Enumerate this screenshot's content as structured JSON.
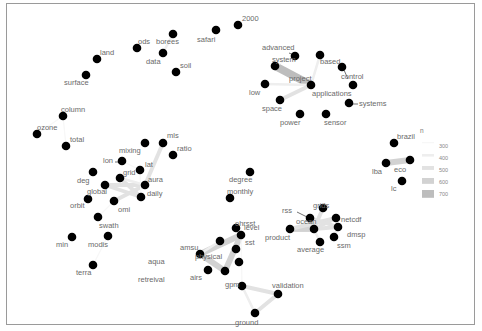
{
  "chart_data": {
    "type": "network",
    "title": "",
    "legend": {
      "title": "n",
      "position": "right",
      "entries": [
        {
          "label": "300",
          "color": "#f7f7f7",
          "width": 1
        },
        {
          "label": "400",
          "color": "#eeeeee",
          "width": 2
        },
        {
          "label": "500",
          "color": "#e2e2e2",
          "width": 3
        },
        {
          "label": "600",
          "color": "#d2d2d2",
          "width": 4.5
        },
        {
          "label": "700",
          "color": "#bdbdbd",
          "width": 6
        }
      ]
    },
    "nodes": [
      {
        "id": "2000",
        "x": 238,
        "y": 25,
        "lx": 242,
        "ly": 21
      },
      {
        "id": "safari",
        "x": 216,
        "y": 30,
        "lx": 197,
        "ly": 42
      },
      {
        "id": "borees",
        "x": 173,
        "y": 34,
        "lx": 156,
        "ly": 44
      },
      {
        "id": "ods",
        "x": 137,
        "y": 48,
        "lx": 138,
        "ly": 44
      },
      {
        "id": "data",
        "x": 163,
        "y": 53,
        "lx": 146,
        "ly": 64
      },
      {
        "id": "soil",
        "x": 176,
        "y": 72,
        "lx": 180,
        "ly": 68
      },
      {
        "id": "land",
        "x": 97,
        "y": 59,
        "lx": 100,
        "ly": 55
      },
      {
        "id": "surface",
        "x": 86,
        "y": 75,
        "lx": 64,
        "ly": 85
      },
      {
        "id": "column",
        "x": 63,
        "y": 116,
        "lx": 61,
        "ly": 112
      },
      {
        "id": "ozone",
        "x": 37,
        "y": 134,
        "lx": 37,
        "ly": 130
      },
      {
        "id": "total",
        "x": 66,
        "y": 146,
        "lx": 70,
        "ly": 142
      },
      {
        "id": "mixing",
        "x": 145,
        "y": 143,
        "lx": 119,
        "ly": 153
      },
      {
        "id": "mls",
        "x": 163,
        "y": 143,
        "lx": 167,
        "ly": 138
      },
      {
        "id": "ratio",
        "x": 173,
        "y": 155,
        "lx": 177,
        "ly": 151
      },
      {
        "id": "lon",
        "x": 122,
        "y": 161,
        "lx": 103,
        "ly": 163
      },
      {
        "id": "lat",
        "x": 140,
        "y": 170,
        "lx": 145,
        "ly": 167
      },
      {
        "id": "deg",
        "x": 93,
        "y": 172,
        "lx": 77,
        "ly": 183
      },
      {
        "id": "grid",
        "x": 120,
        "y": 178,
        "lx": 123,
        "ly": 175
      },
      {
        "id": "global",
        "x": 105,
        "y": 185,
        "lx": 87,
        "ly": 194
      },
      {
        "id": "aura",
        "x": 145,
        "y": 185,
        "lx": 148,
        "ly": 182
      },
      {
        "id": "daily",
        "x": 141,
        "y": 197,
        "lx": 147,
        "ly": 196
      },
      {
        "id": "orbit",
        "x": 88,
        "y": 199,
        "lx": 70,
        "ly": 208
      },
      {
        "id": "omi",
        "x": 114,
        "y": 201,
        "lx": 118,
        "ly": 212
      },
      {
        "id": "swath",
        "x": 98,
        "y": 217,
        "lx": 99,
        "ly": 228
      },
      {
        "id": "min",
        "x": 72,
        "y": 237,
        "lx": 56,
        "ly": 247
      },
      {
        "id": "modis",
        "x": 108,
        "y": 236,
        "lx": 88,
        "ly": 247
      },
      {
        "id": "terra",
        "x": 93,
        "y": 265,
        "lx": 76,
        "ly": 275
      },
      {
        "id": "advanced",
        "x": 295,
        "y": 56,
        "lx": 262,
        "ly": 50
      },
      {
        "id": "system",
        "x": 275,
        "y": 66,
        "lx": 272,
        "ly": 62
      },
      {
        "id": "based",
        "x": 320,
        "y": 55,
        "lx": 320,
        "ly": 64
      },
      {
        "id": "control",
        "x": 342,
        "y": 67,
        "lx": 341,
        "ly": 79
      },
      {
        "id": "project",
        "x": 311,
        "y": 85,
        "lx": 289,
        "ly": 81
      },
      {
        "id": "low",
        "x": 265,
        "y": 84,
        "lx": 249,
        "ly": 95
      },
      {
        "id": "applications",
        "x": 353,
        "y": 85,
        "lx": 312,
        "ly": 96
      },
      {
        "id": "space",
        "x": 280,
        "y": 100,
        "lx": 262,
        "ly": 111
      },
      {
        "id": "systems",
        "x": 349,
        "y": 103,
        "lx": 359,
        "ly": 106
      },
      {
        "id": "power",
        "x": 300,
        "y": 114,
        "lx": 280,
        "ly": 125
      },
      {
        "id": "sensor",
        "x": 326,
        "y": 114,
        "lx": 324,
        "ly": 125
      },
      {
        "id": "brazil",
        "x": 394,
        "y": 143,
        "lx": 397,
        "ly": 139
      },
      {
        "id": "eco",
        "x": 410,
        "y": 160,
        "lx": 394,
        "ly": 172
      },
      {
        "id": "lba",
        "x": 386,
        "y": 163,
        "lx": 372,
        "ly": 174
      },
      {
        "id": "lc",
        "x": 402,
        "y": 181,
        "lx": 391,
        "ly": 191
      },
      {
        "id": "degree",
        "x": 250,
        "y": 172,
        "lx": 229,
        "ly": 182
      },
      {
        "id": "monthly",
        "x": 230,
        "y": 198,
        "lx": 227,
        "ly": 194
      },
      {
        "id": "level",
        "x": 241,
        "y": 235,
        "lx": 244,
        "ly": 230
      },
      {
        "id": "ohrsst",
        "x": 236,
        "y": 228,
        "lx": 235,
        "ly": 226
      },
      {
        "id": "sst",
        "x": 236,
        "y": 249,
        "lx": 245,
        "ly": 245
      },
      {
        "id": "amsu",
        "x": 220,
        "y": 241,
        "lx": 180,
        "ly": 250
      },
      {
        "id": "aqua",
        "x": 200,
        "y": 254,
        "lx": 148,
        "ly": 264
      },
      {
        "id": "physical",
        "x": 239,
        "y": 262,
        "lx": 195,
        "ly": 259
      },
      {
        "id": "retreival",
        "x": 208,
        "y": 270,
        "lx": 138,
        "ly": 282
      },
      {
        "id": "airs",
        "x": 225,
        "y": 271,
        "lx": 190,
        "ly": 280
      },
      {
        "id": "gpm",
        "x": 242,
        "y": 286,
        "lx": 225,
        "ly": 287
      },
      {
        "id": "validation",
        "x": 278,
        "y": 294,
        "lx": 272,
        "ly": 288
      },
      {
        "id": "ground",
        "x": 255,
        "y": 313,
        "lx": 235,
        "ly": 325
      },
      {
        "id": "grids",
        "x": 323,
        "y": 208,
        "lx": 313,
        "ly": 208
      },
      {
        "id": "rss",
        "x": 310,
        "y": 218,
        "lx": 282,
        "ly": 213
      },
      {
        "id": "netcdf",
        "x": 336,
        "y": 218,
        "lx": 341,
        "ly": 222
      },
      {
        "id": "ocean",
        "x": 314,
        "y": 229,
        "lx": 296,
        "ly": 224
      },
      {
        "id": "product",
        "x": 290,
        "y": 229,
        "lx": 265,
        "ly": 240
      },
      {
        "id": "dmsp",
        "x": 338,
        "y": 227,
        "lx": 347,
        "ly": 237
      },
      {
        "id": "ssm",
        "x": 334,
        "y": 237,
        "lx": 337,
        "ly": 248
      },
      {
        "id": "average",
        "x": 320,
        "y": 242,
        "lx": 297,
        "ly": 252
      }
    ],
    "edges": [
      {
        "from": "borees",
        "to": "data",
        "n": 400
      },
      {
        "from": "column",
        "to": "total",
        "n": 300
      },
      {
        "from": "ozone",
        "to": "column",
        "n": 300
      },
      {
        "from": "mls",
        "to": "aura",
        "n": 500
      },
      {
        "from": "grid",
        "to": "daily",
        "n": 500
      },
      {
        "from": "global",
        "to": "daily",
        "n": 500
      },
      {
        "from": "global",
        "to": "aura",
        "n": 500
      },
      {
        "from": "omi",
        "to": "aura",
        "n": 500
      },
      {
        "from": "grid",
        "to": "aura",
        "n": 400
      },
      {
        "from": "lat",
        "to": "daily",
        "n": 300
      },
      {
        "from": "lon",
        "to": "lat",
        "n": 300
      },
      {
        "from": "omi",
        "to": "swath",
        "n": 300
      },
      {
        "from": "modis",
        "to": "terra",
        "n": 300
      },
      {
        "from": "system",
        "to": "project",
        "n": 700
      },
      {
        "from": "low",
        "to": "project",
        "n": 400
      },
      {
        "from": "space",
        "to": "project",
        "n": 500
      },
      {
        "from": "based",
        "to": "project",
        "n": 400
      },
      {
        "from": "advanced",
        "to": "system",
        "n": 300
      },
      {
        "from": "lba",
        "to": "eco",
        "n": 600
      },
      {
        "from": "aqua",
        "to": "level",
        "n": 600
      },
      {
        "from": "aqua",
        "to": "airs",
        "n": 600
      },
      {
        "from": "airs",
        "to": "level",
        "n": 600
      },
      {
        "from": "aqua",
        "to": "amsu",
        "n": 400
      },
      {
        "from": "level",
        "to": "gpm",
        "n": 300
      },
      {
        "from": "gpm",
        "to": "validation",
        "n": 500
      },
      {
        "from": "validation",
        "to": "ground",
        "n": 500
      },
      {
        "from": "gpm",
        "to": "ground",
        "n": 400
      },
      {
        "from": "product",
        "to": "ocean",
        "n": 600
      },
      {
        "from": "product",
        "to": "netcdf",
        "n": 500
      },
      {
        "from": "ocean",
        "to": "netcdf",
        "n": 500
      },
      {
        "from": "grids",
        "to": "ocean",
        "n": 500
      },
      {
        "from": "rss",
        "to": "dmsp",
        "n": 500
      },
      {
        "from": "ocean",
        "to": "dmsp",
        "n": 500
      },
      {
        "from": "ssm",
        "to": "dmsp",
        "n": 400
      },
      {
        "from": "average",
        "to": "ocean",
        "n": 400
      }
    ],
    "arrows": [
      {
        "from": "advanced",
        "x1": 289,
        "y1": 53,
        "x2": 294,
        "y2": 55
      },
      {
        "from": "control",
        "x1": 348,
        "y1": 79,
        "x2": 344,
        "y2": 70
      },
      {
        "from": "systems",
        "x1": 358,
        "y1": 104,
        "x2": 352,
        "y2": 104
      },
      {
        "from": "lon",
        "x1": 115,
        "y1": 162,
        "x2": 119,
        "y2": 162
      },
      {
        "from": "rss",
        "x1": 297,
        "y1": 212,
        "x2": 307,
        "y2": 217
      },
      {
        "from": "retreival",
        "x1": 206,
        "y1": 271,
        "x2": 207,
        "y2": 271
      }
    ]
  }
}
